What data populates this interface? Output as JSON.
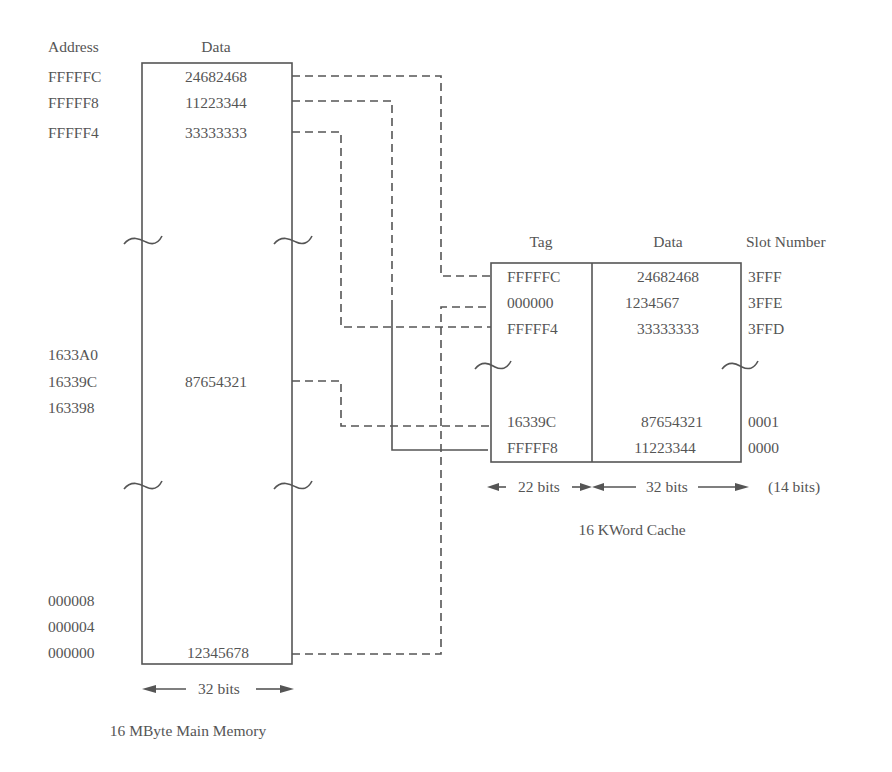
{
  "main_memory": {
    "header_address": "Address",
    "header_data": "Data",
    "caption": "16 MByte Main Memory",
    "width_label": "32 bits",
    "rows": [
      {
        "address": "FFFFFC",
        "data": "24682468"
      },
      {
        "address": "FFFFF8",
        "data": "11223344"
      },
      {
        "address": "FFFFF4",
        "data": "33333333"
      },
      {
        "address": "1633A0",
        "data": ""
      },
      {
        "address": "16339C",
        "data": "87654321"
      },
      {
        "address": "163398",
        "data": ""
      },
      {
        "address": "000008",
        "data": ""
      },
      {
        "address": "000004",
        "data": ""
      },
      {
        "address": "000000",
        "data": "12345678"
      }
    ]
  },
  "cache": {
    "header_tag": "Tag",
    "header_data": "Data",
    "header_slot": "Slot Number",
    "caption": "16 KWord Cache",
    "tag_width_label": "22 bits",
    "data_width_label": "32 bits",
    "slot_width_label": "(14 bits)",
    "rows": [
      {
        "tag": "FFFFFC",
        "data": "24682468",
        "slot": "3FFF"
      },
      {
        "tag": "000000",
        "data": "1234567",
        "slot": "3FFE"
      },
      {
        "tag": "FFFFF4",
        "data": "33333333",
        "slot": "3FFD"
      },
      {
        "tag": "16339C",
        "data": "87654321",
        "slot": "0001"
      },
      {
        "tag": "FFFFF8",
        "data": "11223344",
        "slot": "0000"
      }
    ]
  },
  "colors": {
    "ink": "#555555",
    "background": "#ffffff"
  }
}
